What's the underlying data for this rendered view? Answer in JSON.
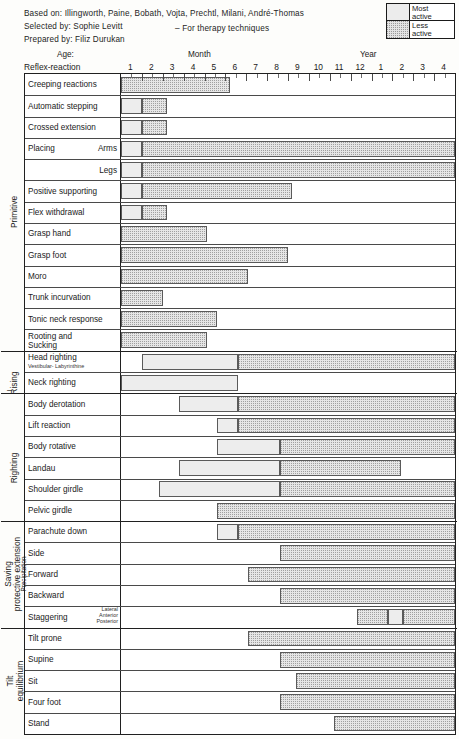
{
  "header": {
    "based_on": "Based on: Illingworth, Paine, Bobath, Vojta, Prechtl, Milani, André-Thomas",
    "selected_by": "Selected by: Sophie Levitt",
    "prepared_by": "Prepared by: Filiz Durukan",
    "note": "– For therapy techniques"
  },
  "legend": {
    "most_line1": "Most",
    "most_line2": "active",
    "less_line1": "Less",
    "less_line2": "active"
  },
  "axis": {
    "row_title": "Reflex-reaction",
    "age_word": "Age:",
    "month_word": "Month",
    "year_word": "Year",
    "ticks": [
      "1",
      "2",
      "3",
      "4",
      "5",
      "6",
      "7",
      "8",
      "9",
      "10",
      "11",
      "12",
      "1",
      "2",
      "3",
      "4"
    ]
  },
  "groups": [
    {
      "name": "Primitive",
      "small": false,
      "dash": ""
    },
    {
      "name": "Rising",
      "small": false,
      "dash": "–"
    },
    {
      "name": "Righting",
      "small": false,
      "dash": ""
    },
    {
      "name": "Saving",
      "small": false,
      "dash": ""
    },
    {
      "name": "protective extension",
      "small": false,
      "dash": ""
    },
    {
      "name": "Precipitation",
      "small": true,
      "dash": ""
    },
    {
      "name": "Tilt",
      "small": false,
      "dash": ""
    },
    {
      "name": "equilibrium",
      "small": false,
      "dash": ""
    }
  ],
  "chart_data": {
    "type": "bar",
    "xlabel": "Age (Months 1–12, Years 1–4)",
    "ylabel": "Reflex-reaction",
    "x_ticks": [
      "1",
      "2",
      "3",
      "4",
      "5",
      "6",
      "7",
      "8",
      "9",
      "10",
      "11",
      "12",
      "1",
      "2",
      "3",
      "4"
    ],
    "x_units": [
      "month",
      "month",
      "month",
      "month",
      "month",
      "month",
      "month",
      "month",
      "month",
      "month",
      "month",
      "month",
      "year",
      "year",
      "year",
      "year"
    ],
    "xlim": [
      0,
      16
    ],
    "grid": true,
    "legend_position": "top-right",
    "series": [
      {
        "name": "Most active",
        "key": "most",
        "color": "#ededed"
      },
      {
        "name": "Less active",
        "key": "less",
        "color": "#e6e6e6"
      }
    ],
    "rows": [
      {
        "label": "Creeping reactions",
        "sublabel": "",
        "rlabel": "",
        "group": "Primitive",
        "bars": [
          {
            "type": "less",
            "start": 0.0,
            "end": 5.2
          }
        ]
      },
      {
        "label": "Automatic stepping",
        "sublabel": "",
        "rlabel": "",
        "group": "Primitive",
        "bars": [
          {
            "type": "most",
            "start": 0.0,
            "end": 1.0
          },
          {
            "type": "less",
            "start": 1.0,
            "end": 2.2
          }
        ]
      },
      {
        "label": "Crossed extension",
        "sublabel": "",
        "rlabel": "",
        "group": "Primitive",
        "bars": [
          {
            "type": "most",
            "start": 0.0,
            "end": 1.0
          },
          {
            "type": "less",
            "start": 1.0,
            "end": 2.2
          }
        ]
      },
      {
        "label": "Placing",
        "sublabel": "",
        "rlabel": "Arms",
        "group": "Primitive",
        "bars": [
          {
            "type": "most",
            "start": 0.0,
            "end": 1.0
          },
          {
            "type": "less",
            "start": 1.0,
            "end": 16.0
          }
        ]
      },
      {
        "label": "",
        "sublabel": "",
        "rlabel": "Legs",
        "group": "Primitive",
        "bars": [
          {
            "type": "most",
            "start": 0.0,
            "end": 1.0
          },
          {
            "type": "less",
            "start": 1.0,
            "end": 16.0
          }
        ]
      },
      {
        "label": "Positive supporting",
        "sublabel": "",
        "rlabel": "",
        "group": "Primitive",
        "bars": [
          {
            "type": "most",
            "start": 0.0,
            "end": 1.0
          },
          {
            "type": "less",
            "start": 1.0,
            "end": 8.2
          }
        ]
      },
      {
        "label": "Flex withdrawal",
        "sublabel": "",
        "rlabel": "",
        "group": "Primitive",
        "bars": [
          {
            "type": "most",
            "start": 0.0,
            "end": 1.0
          },
          {
            "type": "less",
            "start": 1.0,
            "end": 2.2
          }
        ]
      },
      {
        "label": "Grasp hand",
        "sublabel": "",
        "rlabel": "",
        "group": "Primitive",
        "bars": [
          {
            "type": "less",
            "start": 0.0,
            "end": 4.1
          }
        ]
      },
      {
        "label": "Grasp foot",
        "sublabel": "",
        "rlabel": "",
        "group": "Primitive",
        "bars": [
          {
            "type": "less",
            "start": 0.0,
            "end": 8.0
          }
        ]
      },
      {
        "label": "Moro",
        "sublabel": "",
        "rlabel": "",
        "group": "Primitive",
        "bars": [
          {
            "type": "less",
            "start": 0.0,
            "end": 6.1
          }
        ]
      },
      {
        "label": "Trunk incurvation",
        "sublabel": "",
        "rlabel": "",
        "group": "Primitive",
        "bars": [
          {
            "type": "less",
            "start": 0.0,
            "end": 2.0
          }
        ]
      },
      {
        "label": "Tonic neck response",
        "sublabel": "",
        "rlabel": "",
        "group": "Primitive",
        "bars": [
          {
            "type": "less",
            "start": 0.0,
            "end": 4.6
          }
        ]
      },
      {
        "label": "Rooting and",
        "sublabel": "Sucking",
        "rlabel": "",
        "group": "Primitive",
        "bars": [
          {
            "type": "less",
            "start": 0.0,
            "end": 4.1
          }
        ]
      },
      {
        "label": "Head righting",
        "sublabel": "Vestibular- Labyrinthine",
        "rlabel": "",
        "group": "Rising",
        "bars": [
          {
            "type": "most",
            "start": 1.0,
            "end": 5.6
          },
          {
            "type": "less",
            "start": 5.6,
            "end": 16.0
          }
        ]
      },
      {
        "label": "Neck righting",
        "sublabel": "",
        "rlabel": "",
        "group": "Rising",
        "bars": [
          {
            "type": "most",
            "start": 0.0,
            "end": 5.6
          }
        ]
      },
      {
        "label": "Body derotation",
        "sublabel": "",
        "rlabel": "",
        "group": "Righting",
        "bars": [
          {
            "type": "most",
            "start": 2.8,
            "end": 5.6
          },
          {
            "type": "less",
            "start": 5.6,
            "end": 16.0
          }
        ]
      },
      {
        "label": "Lift reaction",
        "sublabel": "",
        "rlabel": "",
        "group": "Righting",
        "bars": [
          {
            "type": "most",
            "start": 4.6,
            "end": 5.6
          },
          {
            "type": "less",
            "start": 5.6,
            "end": 16.0
          }
        ]
      },
      {
        "label": "Body rotative",
        "sublabel": "",
        "rlabel": "",
        "group": "Righting",
        "bars": [
          {
            "type": "most",
            "start": 4.6,
            "end": 7.6
          },
          {
            "type": "less",
            "start": 7.6,
            "end": 16.0
          }
        ]
      },
      {
        "label": "Landau",
        "sublabel": "",
        "rlabel": "",
        "group": "Righting",
        "bars": [
          {
            "type": "most",
            "start": 2.8,
            "end": 7.6
          },
          {
            "type": "less",
            "start": 7.6,
            "end": 13.4
          }
        ]
      },
      {
        "label": "Shoulder girdle",
        "sublabel": "",
        "rlabel": "",
        "group": "Righting",
        "bars": [
          {
            "type": "most",
            "start": 1.8,
            "end": 7.6
          },
          {
            "type": "less",
            "start": 7.6,
            "end": 16.0
          }
        ]
      },
      {
        "label": "Pelvic girdle",
        "sublabel": "",
        "rlabel": "",
        "group": "Righting",
        "bars": [
          {
            "type": "less",
            "start": 4.6,
            "end": 16.0
          }
        ]
      },
      {
        "label": "Parachute down",
        "sublabel": "",
        "rlabel": "",
        "group": "Saving",
        "bars": [
          {
            "type": "most",
            "start": 4.6,
            "end": 5.6
          },
          {
            "type": "less",
            "start": 5.6,
            "end": 16.0
          }
        ]
      },
      {
        "label": "Side",
        "sublabel": "",
        "rlabel": "",
        "group": "Saving",
        "bars": [
          {
            "type": "less",
            "start": 7.6,
            "end": 16.0
          }
        ]
      },
      {
        "label": "Forward",
        "sublabel": "",
        "rlabel": "",
        "group": "Saving",
        "bars": [
          {
            "type": "less",
            "start": 6.1,
            "end": 16.0
          }
        ]
      },
      {
        "label": "Backward",
        "sublabel": "",
        "rlabel": "",
        "group": "Saving",
        "bars": [
          {
            "type": "less",
            "start": 7.6,
            "end": 16.0
          }
        ]
      },
      {
        "label": "Staggering",
        "sublabel": "",
        "rlabel": "Lateral|Anterior|Posterior",
        "group": "Saving",
        "bars": [
          {
            "type": "less",
            "start": 11.3,
            "end": 12.8
          },
          {
            "type": "most",
            "start": 12.8,
            "end": 13.5
          },
          {
            "type": "less",
            "start": 13.5,
            "end": 16.0
          }
        ]
      },
      {
        "label": "Tilt prone",
        "sublabel": "",
        "rlabel": "",
        "group": "Tilt",
        "bars": [
          {
            "type": "less",
            "start": 6.1,
            "end": 16.0
          }
        ]
      },
      {
        "label": "Supine",
        "sublabel": "",
        "rlabel": "",
        "group": "Tilt",
        "bars": [
          {
            "type": "less",
            "start": 7.6,
            "end": 16.0
          }
        ]
      },
      {
        "label": "Sit",
        "sublabel": "",
        "rlabel": "",
        "group": "Tilt",
        "bars": [
          {
            "type": "less",
            "start": 8.4,
            "end": 16.0
          }
        ]
      },
      {
        "label": "Four foot",
        "sublabel": "",
        "rlabel": "",
        "group": "Tilt",
        "bars": [
          {
            "type": "less",
            "start": 7.6,
            "end": 16.0
          }
        ]
      },
      {
        "label": "Stand",
        "sublabel": "",
        "rlabel": "",
        "group": "Tilt",
        "bars": [
          {
            "type": "less",
            "start": 10.2,
            "end": 16.0
          }
        ]
      }
    ],
    "group_breaks_after_row": [
      12,
      14,
      20,
      25
    ]
  }
}
